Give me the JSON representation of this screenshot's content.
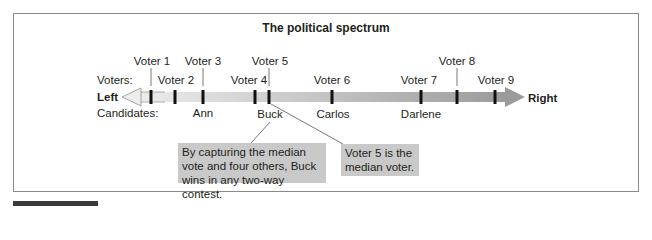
{
  "title": "The political spectrum",
  "row_labels": {
    "voters": "Voters:",
    "candidates": "Candidates:"
  },
  "axis": {
    "left_label": "Left",
    "right_label": "Right"
  },
  "voters": [
    {
      "label": "Voter 1",
      "x": 151,
      "label_row": "upper"
    },
    {
      "label": "Voter 2",
      "x": 175,
      "label_row": "lower"
    },
    {
      "label": "Voter 3",
      "x": 203,
      "label_row": "upper"
    },
    {
      "label": "Voter 4",
      "x": 255,
      "label_row": "lower"
    },
    {
      "label": "Voter 5",
      "x": 269,
      "label_row": "upper"
    },
    {
      "label": "Voter 6",
      "x": 332,
      "label_row": "lower"
    },
    {
      "label": "Voter 7",
      "x": 421,
      "label_row": "lower"
    },
    {
      "label": "Voter 8",
      "x": 457,
      "label_row": "upper"
    },
    {
      "label": "Voter 9",
      "x": 495,
      "label_row": "lower"
    }
  ],
  "candidates": [
    {
      "name": "Ann",
      "x": 203
    },
    {
      "name": "Buck",
      "x": 269
    },
    {
      "name": "Carlos",
      "x": 332
    },
    {
      "name": "Darlene",
      "x": 421
    }
  ],
  "notes": {
    "buck_note": {
      "line1": "By capturing the median",
      "line2": "vote and four others, Buck",
      "line3": "wins in any two-way contest."
    },
    "median_note": {
      "line1": "Voter 5 is the",
      "line2": "median voter."
    }
  },
  "colors": {
    "arrow_left_fill": "#e6e6e6",
    "arrow_right_fill": "#9b9b9b",
    "tick": "#111111",
    "note_bg": "#c9c9c9",
    "frame": "#8a8a8a"
  }
}
